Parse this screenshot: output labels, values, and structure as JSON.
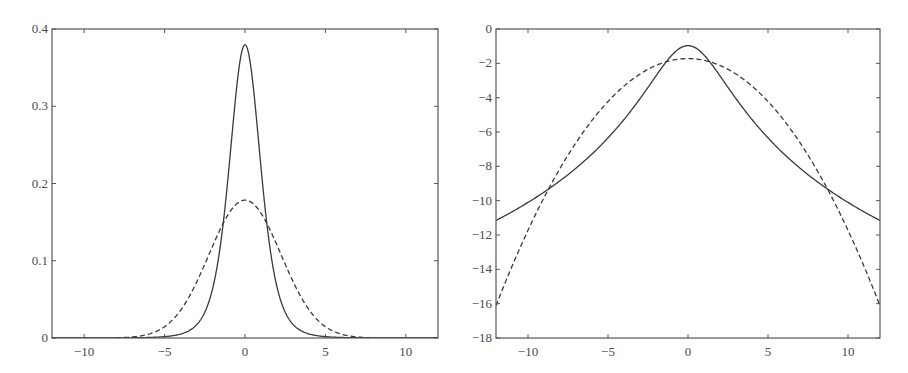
{
  "chart_data": [
    {
      "type": "line",
      "title": "",
      "xlabel": "",
      "ylabel": "",
      "xlim": [
        -12,
        12
      ],
      "ylim": [
        0,
        0.4
      ],
      "grid": false,
      "legend": null,
      "x_ticks": [
        -10,
        -5,
        0,
        5,
        10
      ],
      "x_tick_labels": [
        "−10",
        "−5",
        "0",
        "5",
        "10"
      ],
      "y_ticks": [
        0,
        0.1,
        0.2,
        0.3,
        0.4
      ],
      "y_tick_labels": [
        "0",
        "0.1",
        "0.2",
        "0.3",
        "0.4"
      ],
      "x": [
        -12,
        -10,
        -8,
        -6,
        -5,
        -4,
        -3,
        -2,
        -1.5,
        -1,
        -0.5,
        0,
        0.5,
        1,
        1.5,
        2,
        3,
        4,
        5,
        6,
        8,
        10,
        12
      ],
      "series": [
        {
          "name": "solid (Student-t, nu=5, density)",
          "style": "solid",
          "values": [
            1.45e-05,
            4.02e-05,
            0.000132,
            0.000506,
            0.00176,
            0.00512,
            0.0173,
            0.0651,
            0.1245,
            0.2197,
            0.3279,
            0.3796,
            0.3279,
            0.2197,
            0.1245,
            0.0651,
            0.0173,
            0.00512,
            0.00176,
            0.000506,
            0.000132,
            4.02e-05,
            1.45e-05
          ]
        },
        {
          "name": "dashed (Gaussian, var=5, density)",
          "style": "dashed",
          "values": [
            1e-07,
            8e-07,
            2.98e-05,
            0.000484,
            0.00146,
            0.00362,
            0.0734,
            0.0358,
            0.0732,
            0.1461,
            0.174,
            0.1784,
            0.174,
            0.1461,
            0.0732,
            0.0358,
            0.0734,
            0.00362,
            0.00146,
            0.000484,
            2.98e-05,
            8e-07,
            1e-07
          ]
        }
      ]
    },
    {
      "type": "line",
      "title": "",
      "xlabel": "",
      "ylabel": "",
      "xlim": [
        -12,
        12
      ],
      "ylim": [
        -18,
        0
      ],
      "grid": false,
      "legend": null,
      "x_ticks": [
        -10,
        -5,
        0,
        5,
        10
      ],
      "x_tick_labels": [
        "−10",
        "−5",
        "0",
        "5",
        "10"
      ],
      "y_ticks": [
        0,
        -2,
        -4,
        -6,
        -8,
        -10,
        -12,
        -14,
        -16,
        -18
      ],
      "y_tick_labels": [
        "0",
        "−2",
        "−4",
        "−6",
        "−8",
        "−10",
        "−12",
        "−14",
        "−16",
        "−18"
      ],
      "x": [
        -12,
        -10,
        -8.75,
        -8,
        -6,
        -5,
        -4,
        -3,
        -2,
        -1.4,
        -1,
        0,
        1,
        1.4,
        2,
        3,
        4,
        5,
        6,
        8,
        8.75,
        10,
        12
      ],
      "series": [
        {
          "name": "solid (log density, Student-t nu=5)",
          "style": "solid",
          "values": [
            -11.14,
            -10.12,
            -9.35,
            -8.93,
            -7.59,
            -6.34,
            -5.27,
            -4.06,
            -2.73,
            -1.86,
            -1.52,
            -0.97,
            -1.52,
            -1.86,
            -2.73,
            -4.06,
            -5.27,
            -6.34,
            -7.59,
            -8.93,
            -9.35,
            -10.12,
            -11.14
          ]
        },
        {
          "name": "dashed (log density, Gaussian var=5)",
          "style": "dashed",
          "values": [
            -16.13,
            -11.73,
            -9.38,
            -8.13,
            -5.33,
            -4.23,
            -3.33,
            -2.63,
            -2.13,
            -1.92,
            -1.83,
            -1.73,
            -1.83,
            -1.92,
            -2.13,
            -2.63,
            -3.33,
            -4.23,
            -5.33,
            -8.13,
            -9.38,
            -11.73,
            -16.13
          ]
        }
      ]
    }
  ],
  "plots": {
    "left": {
      "frame": {
        "x": 52,
        "y": 29,
        "w": 386,
        "h": 309
      },
      "params": {
        "nu": 5,
        "gauss_var": 5,
        "mode": "density"
      }
    },
    "right": {
      "frame": {
        "x": 496,
        "y": 29,
        "w": 384,
        "h": 309
      },
      "params": {
        "nu": 5,
        "gauss_var": 5,
        "mode": "log"
      }
    }
  },
  "colors": {
    "axis": "#555555",
    "line": "#3a3a3a",
    "label": "#4a4a4a",
    "background": "#ffffff"
  }
}
